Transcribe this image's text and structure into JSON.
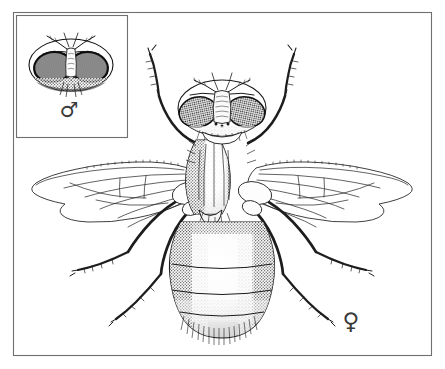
{
  "figure": {
    "medium": "pen-and-ink stipple drawing",
    "background_color": "#ffffff",
    "ink_color": "#1a1a1a",
    "frame": {
      "name": "outer-plate-border",
      "x": 13,
      "y": 12,
      "width": 419,
      "height": 344,
      "stroke_color": "#6f6f6f",
      "stroke_width": 1
    },
    "inset": {
      "name": "male-head-inset",
      "x": 16,
      "y": 15,
      "width": 112,
      "height": 123,
      "stroke_color": "#6f6f6f",
      "stroke_width": 1,
      "caption_symbol": "♂",
      "caption_label": "male",
      "subject": "male head, frontal view, holoptic eyes",
      "eye_shading": "dark stipple"
    },
    "main_subject": {
      "name": "female-fly-dorsal",
      "caption_symbol": "♀",
      "caption_label": "female",
      "caption_x": 351,
      "caption_y": 322,
      "view": "dorsal",
      "eye_arrangement": "dichoptic"
    },
    "anatomy_labels": [
      "head",
      "compound-eye",
      "antenna",
      "arista",
      "frons",
      "ocelli",
      "thorax",
      "scutum",
      "scutellum",
      "wing",
      "wing-vein",
      "halter",
      "abdomen",
      "abdominal-segment",
      "foreleg",
      "midleg",
      "hindleg",
      "femur",
      "tibia",
      "tarsus",
      "bristles"
    ]
  }
}
